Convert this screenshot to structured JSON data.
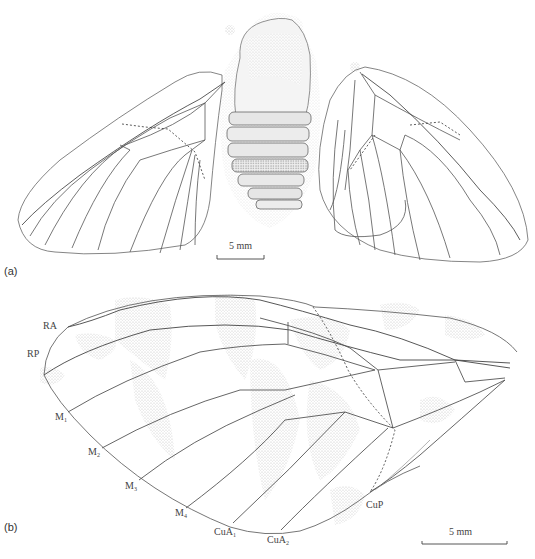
{
  "figure": {
    "panels": [
      {
        "id": "a",
        "label": "(a)",
        "description": "Fossil insect with both forewings spread and abdomen segments",
        "scale_bar": {
          "text": "5 mm"
        }
      },
      {
        "id": "b",
        "label": "(b)",
        "description": "Detailed forewing venation drawing with color pattern stippling",
        "scale_bar": {
          "text": "5 mm"
        },
        "vein_labels": [
          {
            "main": "RA",
            "sub": ""
          },
          {
            "main": "RP",
            "sub": ""
          },
          {
            "main": "M",
            "sub": "1"
          },
          {
            "main": "M",
            "sub": "2"
          },
          {
            "main": "M",
            "sub": "3"
          },
          {
            "main": "M",
            "sub": "4"
          },
          {
            "main": "CuA",
            "sub": "1"
          },
          {
            "main": "CuA",
            "sub": "2"
          },
          {
            "main": "CuP",
            "sub": ""
          }
        ]
      }
    ],
    "colors": {
      "line": "#555555",
      "vein": "#4a4a4a",
      "stipple": "#c8c8c8",
      "background": "#ffffff"
    }
  }
}
